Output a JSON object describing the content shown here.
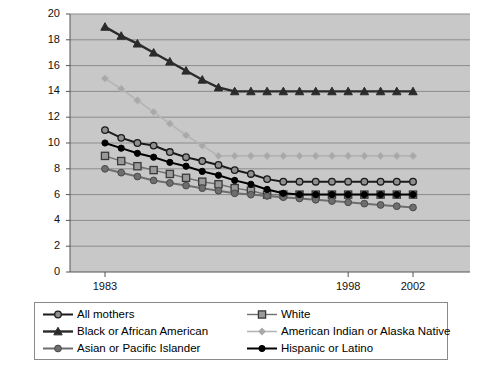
{
  "chart_data": {
    "type": "line",
    "title": "",
    "subtitle": "",
    "xlabel": "",
    "ylabel": "",
    "xlim": [
      1983,
      2002
    ],
    "ylim": [
      0,
      20
    ],
    "ytick_step": 2,
    "yticks": [
      0,
      2,
      4,
      6,
      8,
      10,
      12,
      14,
      16,
      18,
      20
    ],
    "xticks": [
      1983,
      1998,
      2002
    ],
    "xtick_labels": [
      "1983",
      "1998",
      "2002"
    ],
    "x": [
      1983,
      1984,
      1985,
      1986,
      1987,
      1988,
      1989,
      1990,
      1991,
      1992,
      1993,
      1994,
      1995,
      1996,
      1997,
      1998,
      1999,
      2000,
      2001,
      2002
    ],
    "grid": "horizontal",
    "plot_background": "#c8c8c8",
    "legend_position": "bottom",
    "legend_columns": 2,
    "series": [
      {
        "name": "All mothers",
        "marker": "circle-open-dark",
        "color": "#1a1a1a",
        "marker_fill": "#8f8f8f",
        "values": [
          11.0,
          10.4,
          10.0,
          9.8,
          9.3,
          8.9,
          8.6,
          8.3,
          7.9,
          7.6,
          7.2,
          7.0,
          7.0,
          7.0,
          7.0,
          7.0,
          7.0,
          7.0,
          7.0,
          7.0
        ]
      },
      {
        "name": "White",
        "marker": "square-open",
        "color": "#707070",
        "marker_fill": "#9a9a9a",
        "values": [
          9.0,
          8.6,
          8.2,
          7.9,
          7.6,
          7.3,
          7.0,
          6.8,
          6.5,
          6.3,
          6.0,
          6.0,
          6.0,
          6.0,
          6.0,
          6.0,
          6.0,
          6.0,
          6.0,
          6.0
        ]
      },
      {
        "name": "Black or African American",
        "marker": "triangle",
        "color": "#2b2b2b",
        "marker_fill": "#2b2b2b",
        "values": [
          19.0,
          18.3,
          17.7,
          17.0,
          16.3,
          15.6,
          14.9,
          14.3,
          14.0,
          14.0,
          14.0,
          14.0,
          14.0,
          14.0,
          14.0,
          14.0,
          14.0,
          14.0,
          14.0,
          14.0
        ]
      },
      {
        "name": "American Indian or Alaska Native",
        "marker": "diamond",
        "color": "#b4b4b4",
        "marker_fill": "#a8a8a8",
        "values": [
          15.0,
          14.2,
          13.3,
          12.4,
          11.5,
          10.6,
          9.8,
          9.0,
          9.0,
          9.0,
          9.0,
          9.0,
          9.0,
          9.0,
          9.0,
          9.0,
          9.0,
          9.0,
          9.0,
          9.0
        ]
      },
      {
        "name": "Asian or Pacific Islander",
        "marker": "circle-filled-gray",
        "color": "#6e6e6e",
        "marker_fill": "#6e6e6e",
        "values": [
          8.0,
          7.7,
          7.4,
          7.1,
          6.9,
          6.7,
          6.5,
          6.3,
          6.1,
          6.0,
          5.9,
          5.8,
          5.7,
          5.6,
          5.5,
          5.4,
          5.3,
          5.2,
          5.1,
          5.0
        ]
      },
      {
        "name": "Hispanic or Latino",
        "marker": "circle-filled-black",
        "color": "#000000",
        "marker_fill": "#000000",
        "values": [
          10.0,
          9.6,
          9.2,
          8.9,
          8.5,
          8.2,
          7.8,
          7.5,
          7.1,
          6.8,
          6.4,
          6.1,
          6.0,
          6.0,
          6.0,
          6.0,
          6.0,
          6.0,
          6.0,
          6.0
        ]
      }
    ]
  },
  "legend": {
    "left_column": [
      {
        "label": "All mothers"
      },
      {
        "label": "Black or African American"
      },
      {
        "label": "Asian or Pacific Islander"
      }
    ],
    "right_column": [
      {
        "label": "White"
      },
      {
        "label": "American Indian or Alaska Native"
      },
      {
        "label": "Hispanic or Latino"
      }
    ]
  },
  "axes": {
    "y_labels": [
      "20",
      "18",
      "16",
      "14",
      "12",
      "10",
      "8",
      "6",
      "4",
      "2",
      "0"
    ],
    "x_labels": [
      "1983",
      "1998",
      "2002"
    ]
  }
}
